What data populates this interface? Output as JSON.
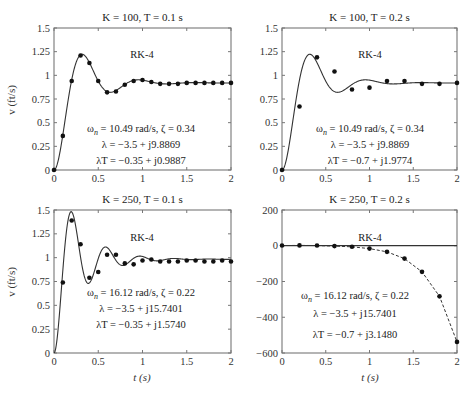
{
  "figure": {
    "ylabel": "v (ft/s)",
    "xlabel": "t (s)"
  },
  "chart_data": [
    {
      "type": "line",
      "title": "K = 100, T = 0.1 s",
      "method_label": "RK-4",
      "annotations": [
        "ωn = 10.49 rad/s, ζ = 0.34",
        "λ = −3.5 + j9.8869",
        "λT = −0.35 + j0.9887"
      ],
      "xlabel": "",
      "ylabel": "v (ft/s)",
      "xlim": [
        0,
        2
      ],
      "ylim": [
        0,
        1.5
      ],
      "xticks": [
        0,
        0.5,
        1,
        1.5,
        2
      ],
      "xtick_labels": [
        "0",
        "0.5",
        "1",
        "1.5",
        "2"
      ],
      "yticks": [
        0,
        0.25,
        0.5,
        0.75,
        1,
        1.25,
        1.5
      ],
      "ytick_labels": [
        "0",
        "0.25",
        "0.5",
        "0.75",
        "1",
        "1.25",
        "1.5"
      ],
      "grid": false,
      "series": [
        {
          "name": "exact",
          "style": "solid",
          "K": 100
        },
        {
          "name": "RK-4",
          "style": "markers",
          "x": [
            0,
            0.1,
            0.2,
            0.3,
            0.4,
            0.5,
            0.6,
            0.7,
            0.8,
            0.9,
            1.0,
            1.1,
            1.2,
            1.3,
            1.4,
            1.5,
            1.6,
            1.7,
            1.8,
            1.9,
            2.0
          ],
          "y": [
            0,
            0.36,
            0.94,
            1.21,
            1.13,
            0.94,
            0.82,
            0.83,
            0.9,
            0.94,
            0.95,
            0.93,
            0.91,
            0.91,
            0.91,
            0.92,
            0.92,
            0.92,
            0.92,
            0.92,
            0.92
          ]
        }
      ]
    },
    {
      "type": "line",
      "title": "K = 100, T = 0.2 s",
      "method_label": "RK-4",
      "annotations": [
        "ωn = 10.49 rad/s, ζ = 0.34",
        "λ = −3.5 + j9.8869",
        "λT = −0.7 + j1.9774"
      ],
      "xlabel": "",
      "ylabel": "",
      "xlim": [
        0,
        2
      ],
      "ylim": [
        0,
        1.5
      ],
      "xticks": [
        0,
        0.5,
        1,
        1.5,
        2
      ],
      "xtick_labels": [
        "0",
        "0.5",
        "1",
        "1.5",
        "2"
      ],
      "yticks": [
        0,
        0.25,
        0.5,
        0.75,
        1,
        1.25,
        1.5
      ],
      "ytick_labels": [
        "0",
        "0.25",
        "0.5",
        "0.75",
        "1",
        "1.25",
        "1.5"
      ],
      "grid": false,
      "series": [
        {
          "name": "exact",
          "style": "solid",
          "K": 100
        },
        {
          "name": "RK-4",
          "style": "markers",
          "x": [
            0,
            0.2,
            0.4,
            0.6,
            0.8,
            1.0,
            1.2,
            1.4,
            1.6,
            1.8,
            2.0
          ],
          "y": [
            0,
            0.67,
            1.19,
            1.04,
            0.85,
            0.87,
            0.94,
            0.94,
            0.91,
            0.91,
            0.92
          ]
        }
      ]
    },
    {
      "type": "line",
      "title": "K = 250, T = 0.1 s",
      "method_label": "RK-4",
      "annotations": [
        "ωn = 16.12 rad/s, ζ = 0.22",
        "λ = −3.5 + j15.7401",
        "λT = −0.35 + j1.5740"
      ],
      "xlabel": "t (s)",
      "ylabel": "v (ft/s)",
      "xlim": [
        0,
        2
      ],
      "ylim": [
        0,
        1.5
      ],
      "xticks": [
        0,
        0.5,
        1,
        1.5,
        2
      ],
      "xtick_labels": [
        "0",
        "0.5",
        "1",
        "1.5",
        "2"
      ],
      "yticks": [
        0,
        0.25,
        0.5,
        0.75,
        1,
        1.25,
        1.5
      ],
      "ytick_labels": [
        "0",
        "0.25",
        "0.5",
        "0.75",
        "1",
        "1.25",
        "1.5"
      ],
      "grid": false,
      "series": [
        {
          "name": "exact",
          "style": "solid",
          "K": 250
        },
        {
          "name": "RK-4",
          "style": "markers",
          "x": [
            0.1,
            0.2,
            0.3,
            0.4,
            0.5,
            0.6,
            0.7,
            0.8,
            0.9,
            1.0,
            1.1,
            1.2,
            1.3,
            1.4,
            1.5,
            1.6,
            1.7,
            1.8,
            1.9,
            2.0
          ],
          "y": [
            0.74,
            1.39,
            1.14,
            0.79,
            0.85,
            1.03,
            1.03,
            0.94,
            0.93,
            0.97,
            0.98,
            0.96,
            0.96,
            0.96,
            0.97,
            0.97,
            0.96,
            0.96,
            0.97,
            0.96
          ]
        }
      ]
    },
    {
      "type": "line",
      "title": "K = 250, T = 0.2 s",
      "method_label": "RK-4",
      "annotations": [
        "ωn = 16.12 rad/s, ζ = 0.22",
        "λ = −3.5 + j15.7401",
        "λT = −0.7 + j3.1480"
      ],
      "xlabel": "t (s)",
      "ylabel": "",
      "xlim": [
        0,
        2
      ],
      "ylim": [
        -600,
        200
      ],
      "xticks": [
        0,
        0.5,
        1,
        1.5,
        2
      ],
      "xtick_labels": [
        "0",
        "0.5",
        "1",
        "1.5",
        "2"
      ],
      "yticks": [
        -600,
        -400,
        -200,
        0,
        200
      ],
      "ytick_labels": [
        "−600",
        "−400",
        "−200",
        "0",
        "200"
      ],
      "grid": false,
      "series": [
        {
          "name": "exact",
          "style": "solid",
          "x": [
            0,
            2
          ],
          "y": [
            0.96,
            0.96
          ]
        },
        {
          "name": "RK-4",
          "style": "dashed-markers",
          "x": [
            0,
            0.2,
            0.4,
            0.6,
            0.8,
            1.0,
            1.2,
            1.4,
            1.6,
            1.8,
            2.0
          ],
          "y": [
            1,
            2,
            1,
            -2,
            -6,
            -16,
            -34,
            -72,
            -146,
            -283,
            -538
          ]
        }
      ]
    }
  ]
}
